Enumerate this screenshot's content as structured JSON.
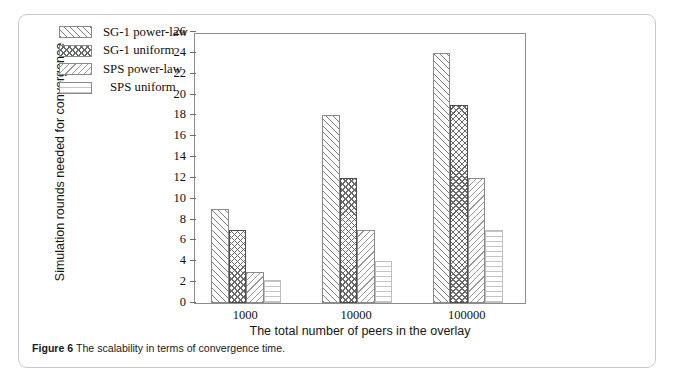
{
  "figure": {
    "caption_label": "Figure 6",
    "caption_text": "The scalability in terms of convergence time."
  },
  "chart_data": {
    "type": "bar",
    "title": "",
    "xlabel": "The total number of peers in the overlay",
    "ylabel": "Simulation rounds needed for convergence",
    "categories": [
      "1000",
      "10000",
      "100000"
    ],
    "series": [
      {
        "name": "SG-1 power-law",
        "pattern": "forward-diagonal",
        "values": [
          9,
          18,
          24
        ]
      },
      {
        "name": "SG-1 uniform",
        "pattern": "cross-hatch",
        "values": [
          7,
          12,
          19
        ]
      },
      {
        "name": "SPS power-law",
        "pattern": "backward-diagonal",
        "values": [
          3,
          7,
          12
        ]
      },
      {
        "name": "SPS uniform",
        "pattern": "horizontal-lines",
        "values": [
          2.2,
          4,
          7
        ]
      }
    ],
    "ylim": [
      0,
      26
    ],
    "ytick_step": 2,
    "yticks": [
      0,
      2,
      4,
      6,
      8,
      10,
      12,
      14,
      16,
      18,
      20,
      22,
      24,
      26
    ],
    "grid": false,
    "legend_position": "top-left-inside"
  }
}
